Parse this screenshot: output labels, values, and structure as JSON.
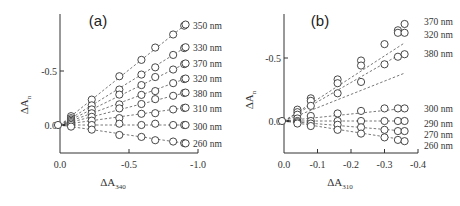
{
  "chart_data": [
    {
      "type": "scatter",
      "panel": "(a)",
      "xlabel": "ΔA",
      "xlabel_sub": "340",
      "ylabel": "ΔA",
      "ylabel_sub": "n",
      "xlim": [
        0.0,
        -1.0
      ],
      "ylim": [
        0.27,
        -0.95
      ],
      "xticks": [
        0.0,
        -0.5,
        -1.0
      ],
      "xtick_labels": [
        "0.0",
        "-0.5",
        "-1.0"
      ],
      "yticks": [
        0.0,
        -0.5
      ],
      "ytick_labels": [
        "0.0",
        "-0.5"
      ],
      "grid": false,
      "marker": "open-circle",
      "fit_lines": "dashed",
      "x": [
        0.0,
        -0.08,
        -0.23,
        -0.43,
        -0.59,
        -0.69,
        -0.82,
        -0.9,
        -0.91
      ],
      "series": [
        {
          "name": "350 nm",
          "slope": 1.02
        },
        {
          "name": "330 nm",
          "slope": 0.79
        },
        {
          "name": "370 nm",
          "slope": 0.63
        },
        {
          "name": "320 nm",
          "slope": 0.48
        },
        {
          "name": "380 nm",
          "slope": 0.33
        },
        {
          "name": "310 nm",
          "slope": 0.18
        },
        {
          "name": "300 nm",
          "slope": 0.0
        },
        {
          "name": "260 nm",
          "slope": -0.18
        }
      ],
      "endpoint_values": {
        "350 nm": -0.93,
        "330 nm": -0.72,
        "370 nm": -0.57,
        "320 nm": -0.43,
        "380 nm": -0.3,
        "310 nm": -0.16,
        "300 nm": 0.0,
        "260 nm": 0.17
      }
    },
    {
      "type": "scatter",
      "panel": "(b)",
      "xlabel": "ΔA",
      "xlabel_sub": "310",
      "ylabel": "ΔA",
      "ylabel_sub": "n",
      "xlim": [
        0.0,
        -0.4
      ],
      "ylim": [
        0.25,
        -0.8
      ],
      "xticks": [
        0.0,
        -0.1,
        -0.2,
        -0.3,
        -0.4
      ],
      "xtick_labels": [
        "0.0",
        "-0.1",
        "-0.2",
        "-0.3",
        "-0.4"
      ],
      "yticks": [
        0.0,
        -0.5
      ],
      "ytick_labels": [
        "0.0",
        "-0.5"
      ],
      "grid": false,
      "marker": "open-circle",
      "fit_lines": "dashed",
      "x": [
        0.0,
        -0.04,
        -0.08,
        -0.16,
        -0.23,
        -0.3,
        -0.34,
        -0.36
      ],
      "series": [
        {
          "name": "370 nm",
          "points": [
            [
              0,
              0
            ],
            [
              -0.04,
              -0.09
            ],
            [
              -0.08,
              -0.18
            ],
            [
              -0.16,
              -0.33
            ],
            [
              -0.23,
              -0.48
            ],
            [
              -0.3,
              -0.61
            ],
            [
              -0.34,
              -0.72
            ],
            [
              -0.36,
              -0.77
            ]
          ]
        },
        {
          "name": "320 nm",
          "points": [
            [
              0,
              0
            ],
            [
              -0.04,
              -0.07
            ],
            [
              -0.08,
              -0.16
            ],
            [
              -0.16,
              -0.3
            ],
            [
              -0.23,
              -0.44
            ],
            [
              -0.3,
              -0.45
            ],
            [
              -0.34,
              -0.7
            ],
            [
              -0.36,
              -0.7
            ]
          ]
        },
        {
          "name": "380 nm",
          "points": [
            [
              0,
              0
            ],
            [
              -0.04,
              -0.05
            ],
            [
              -0.08,
              -0.12
            ],
            [
              -0.16,
              -0.22
            ],
            [
              -0.23,
              -0.31
            ],
            [
              -0.34,
              -0.51
            ],
            [
              -0.36,
              -0.53
            ]
          ]
        },
        {
          "name": "300 nm",
          "points": [
            [
              0,
              0
            ],
            [
              -0.04,
              -0.02
            ],
            [
              -0.08,
              -0.04
            ],
            [
              -0.16,
              -0.06
            ],
            [
              -0.23,
              -0.08
            ],
            [
              -0.3,
              -0.1
            ],
            [
              -0.34,
              -0.1
            ],
            [
              -0.36,
              -0.1
            ]
          ]
        },
        {
          "name": "290 nm",
          "points": [
            [
              0,
              0
            ],
            [
              -0.04,
              0.0
            ],
            [
              -0.08,
              0.0
            ],
            [
              -0.16,
              0.0
            ],
            [
              -0.23,
              0.0
            ],
            [
              -0.3,
              0.0
            ],
            [
              -0.34,
              0.0
            ],
            [
              -0.36,
              0.0
            ]
          ]
        },
        {
          "name": "270 nm",
          "points": [
            [
              0,
              0
            ],
            [
              -0.04,
              0.01
            ],
            [
              -0.08,
              0.02
            ],
            [
              -0.16,
              0.03
            ],
            [
              -0.23,
              0.05
            ],
            [
              -0.3,
              0.07
            ],
            [
              -0.34,
              0.08
            ],
            [
              -0.36,
              0.08
            ]
          ]
        },
        {
          "name": "260 nm",
          "points": [
            [
              0,
              0
            ],
            [
              -0.04,
              0.02
            ],
            [
              -0.08,
              0.04
            ],
            [
              -0.16,
              0.07
            ],
            [
              -0.23,
              0.1
            ],
            [
              -0.3,
              0.13
            ],
            [
              -0.34,
              0.15
            ],
            [
              -0.36,
              0.16
            ]
          ]
        }
      ]
    }
  ],
  "panels": {
    "a": {
      "label": "(a)",
      "xlabel": "ΔA",
      "xsub": "340",
      "ylabel": "ΔA",
      "ysub": "n"
    },
    "b": {
      "label": "(b)",
      "xlabel": "ΔA",
      "xsub": "310",
      "ylabel": "ΔA",
      "ysub": "n"
    }
  }
}
